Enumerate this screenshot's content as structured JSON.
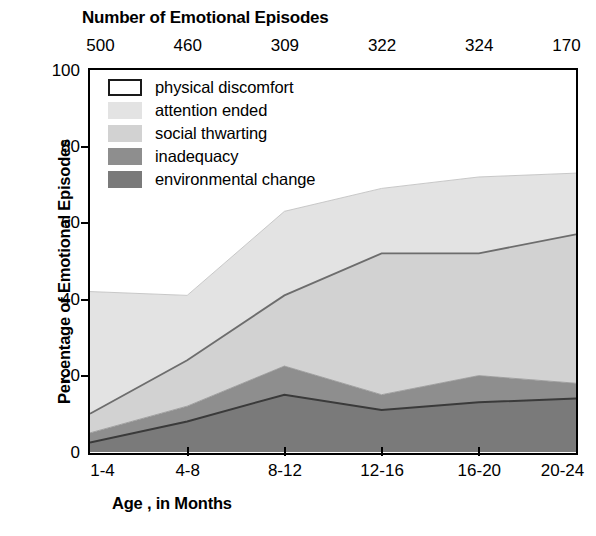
{
  "header": {
    "title": "Number of Emotional Episodes",
    "episode_counts": [
      "500",
      "460",
      "309",
      "322",
      "324",
      "170"
    ]
  },
  "axes": {
    "ylabel": "Percentage of Emotional Episodes",
    "xlabel": "Age , in Months",
    "yticks": [
      "0",
      "20",
      "40",
      "60",
      "80",
      "100"
    ],
    "xticks": [
      "1-4",
      "4-8",
      "8-12",
      "12-16",
      "16-20",
      "20-24"
    ]
  },
  "legend": {
    "items": [
      {
        "label": "physical discomfort",
        "icon": "legend-swatch-white",
        "color": "#ffffff",
        "border": "#1a1a1a"
      },
      {
        "label": "attention ended",
        "icon": "legend-swatch-lightest",
        "color": "#e3e3e3",
        "border": "#e3e3e3"
      },
      {
        "label": "social thwarting",
        "icon": "legend-swatch-light",
        "color": "#d2d2d2",
        "border": "#d2d2d2"
      },
      {
        "label": "inadequacy",
        "icon": "legend-swatch-medium",
        "color": "#8e8e8e",
        "border": "#8e8e8e"
      },
      {
        "label": "environmental change",
        "icon": "legend-swatch-dark",
        "color": "#7a7a7a",
        "border": "#7a7a7a"
      }
    ]
  },
  "chart_data": {
    "type": "area",
    "title": "Number of Emotional Episodes",
    "subtitle": "",
    "xlabel": "Age , in Months",
    "ylabel": "Percentage of Emotional Episodes",
    "categories": [
      "1-4",
      "4-8",
      "8-12",
      "12-16",
      "16-20",
      "20-24"
    ],
    "secondary_axis": {
      "label": "Number of Emotional Episodes",
      "position": "top",
      "values": [
        500,
        460,
        309,
        322,
        324,
        170
      ]
    },
    "ylim": [
      0,
      100
    ],
    "yticks": [
      0,
      20,
      40,
      60,
      80,
      100
    ],
    "grid": false,
    "legend_position": "inside-top-left",
    "stacked": true,
    "stack_order_bottom_to_top": [
      "environmental change",
      "inadequacy",
      "social thwarting",
      "attention ended",
      "physical discomfort"
    ],
    "series": [
      {
        "name": "environmental change",
        "color": "#7a7a7a",
        "values": [
          2.5,
          8,
          15,
          11,
          13,
          14
        ]
      },
      {
        "name": "inadequacy",
        "color": "#8e8e8e",
        "values": [
          2.5,
          4,
          7.5,
          4,
          7,
          4
        ]
      },
      {
        "name": "social thwarting",
        "color": "#d2d2d2",
        "values": [
          5,
          12,
          18.5,
          37,
          32,
          39
        ]
      },
      {
        "name": "attention ended",
        "color": "#e3e3e3",
        "values": [
          32,
          17,
          22,
          17,
          20,
          16
        ]
      },
      {
        "name": "physical discomfort",
        "color": "#ffffff",
        "values": [
          58,
          59,
          37,
          31,
          28,
          27
        ]
      }
    ],
    "cumulative_boundaries": {
      "environmental_change_top": [
        2.5,
        8,
        15,
        11,
        13,
        14
      ],
      "inadequacy_top": [
        5,
        12,
        22.5,
        15,
        20,
        18
      ],
      "social_thwarting_top": [
        10,
        24,
        41,
        52,
        52,
        57
      ],
      "attention_ended_top": [
        42,
        41,
        63,
        69,
        72,
        73
      ]
    }
  }
}
